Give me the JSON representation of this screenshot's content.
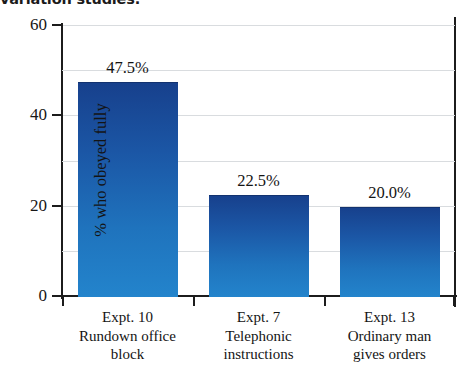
{
  "figure": {
    "title": "variation studies."
  },
  "chart_data": {
    "type": "bar",
    "title": "variation studies.",
    "xlabel": "",
    "ylabel": "% who obeyed fully",
    "ylim": [
      0,
      60
    ],
    "yticks": [
      0,
      20,
      40,
      60
    ],
    "ytick_labels": [
      "0",
      "20",
      "40",
      "60"
    ],
    "gridlines": [
      10,
      20,
      30,
      40,
      50,
      60
    ],
    "grid": true,
    "legend": "none",
    "bar_color_top": "#17408c",
    "bar_color_bottom": "#2384cc",
    "categories": [
      "Expt. 10 Rundown office block",
      "Expt. 7 Telephonic instructions",
      "Expt. 13 Ordinary man gives orders"
    ],
    "category_lines": [
      [
        "Expt. 10",
        "Rundown office",
        "block"
      ],
      [
        "Expt. 7",
        "Telephonic",
        "instructions"
      ],
      [
        "Expt. 13",
        "Ordinary man",
        "gives orders"
      ]
    ],
    "values": [
      47.5,
      22.5,
      20.0
    ],
    "value_labels": [
      "47.5%",
      "22.5%",
      "20.0%"
    ]
  }
}
